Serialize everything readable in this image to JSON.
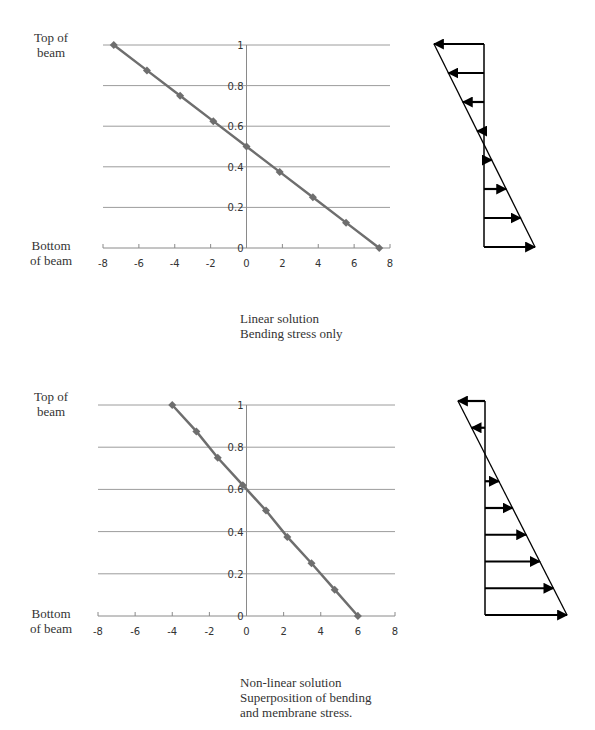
{
  "charts": [
    {
      "top_label": [
        "Top of",
        "beam"
      ],
      "bottom_label": [
        "Bottom",
        "of beam"
      ],
      "caption": [
        "Linear solution",
        "Bending stress only"
      ]
    },
    {
      "top_label": [
        "Top of",
        "beam"
      ],
      "bottom_label": [
        "Bottom",
        "of beam"
      ],
      "caption": [
        "Non-linear solution",
        "Superposition of bending",
        "and membrane stress."
      ]
    }
  ],
  "colors": {
    "series_line": "#6e6e6e",
    "gridline": "#9c9c9c",
    "axis": "#8a8a8a",
    "arrow": "#000000"
  },
  "chart_data": [
    {
      "type": "line",
      "title": "Linear solution - Bending stress only",
      "xlabel": "",
      "ylabel": "",
      "y_annotations": {
        "top": "Top of beam",
        "bottom": "Bottom of beam"
      },
      "xlim": [
        -8,
        8
      ],
      "ylim": [
        0,
        1
      ],
      "x_ticks": [
        -8,
        -6,
        -4,
        -2,
        0,
        2,
        4,
        6,
        8
      ],
      "y_ticks": [
        0,
        0.2,
        0.4,
        0.6,
        0.8,
        1
      ],
      "grid": "horizontal",
      "legend": "none",
      "marker": "diamond",
      "series": [
        {
          "name": "stress",
          "x": [
            -7.4,
            -5.55,
            -3.7,
            -1.85,
            0,
            1.85,
            3.7,
            5.55,
            7.4
          ],
          "y": [
            1,
            0.875,
            0.75,
            0.625,
            0.5,
            0.375,
            0.25,
            0.125,
            0
          ]
        }
      ]
    },
    {
      "type": "line",
      "title": "Non-linear solution - Superposition of bending and membrane stress.",
      "xlabel": "",
      "ylabel": "",
      "y_annotations": {
        "top": "Top of beam",
        "bottom": "Bottom of beam"
      },
      "xlim": [
        -8,
        8
      ],
      "ylim": [
        0,
        1
      ],
      "x_ticks": [
        -8,
        -6,
        -4,
        -2,
        0,
        2,
        4,
        6,
        8
      ],
      "y_ticks": [
        0,
        0.2,
        0.4,
        0.6,
        0.8,
        1
      ],
      "grid": "horizontal",
      "legend": "none",
      "marker": "diamond",
      "series": [
        {
          "name": "stress",
          "x": [
            -4,
            -2.7,
            -1.55,
            -0.2,
            1.05,
            2.2,
            3.5,
            4.75,
            6
          ],
          "y": [
            1,
            0.875,
            0.75,
            0.62,
            0.5,
            0.375,
            0.25,
            0.125,
            0
          ]
        }
      ]
    }
  ],
  "diagrams": [
    {
      "name": "linear-stress-distribution",
      "axis_x": 484,
      "y_top": 44,
      "y_bottom": 247,
      "diag_top_x": 434,
      "diag_bottom_x": 535,
      "arrow_count": 8
    },
    {
      "name": "nonlinear-stress-distribution",
      "axis_x": 485,
      "y_top": 401,
      "y_bottom": 615,
      "diag_top_x": 458,
      "diag_bottom_x": 567,
      "arrow_count": 9
    }
  ]
}
